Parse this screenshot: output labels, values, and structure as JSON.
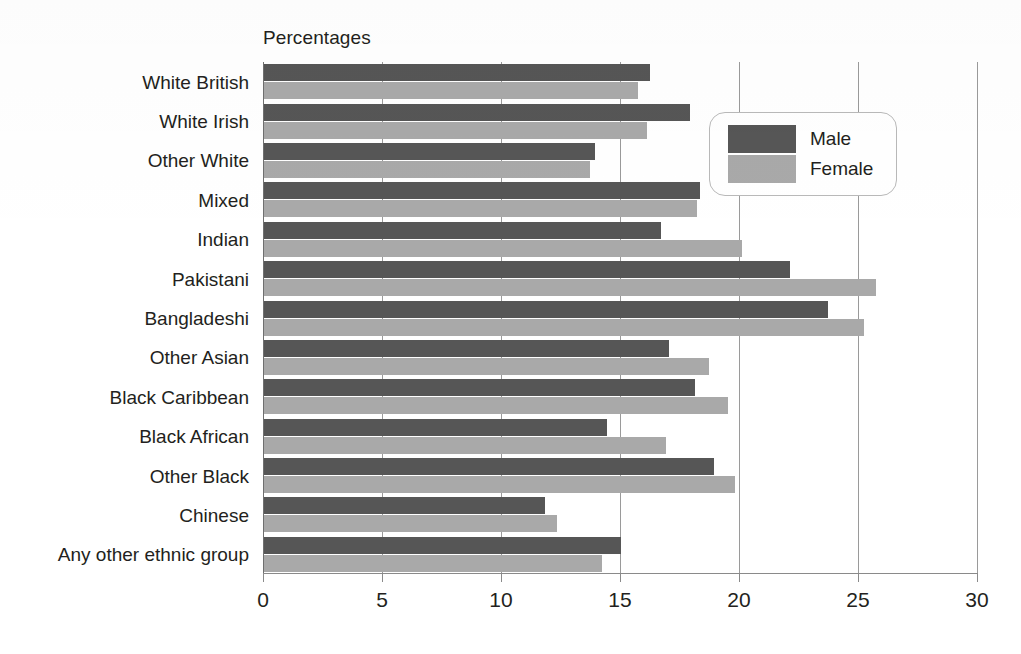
{
  "chart_data": {
    "type": "bar",
    "orientation": "horizontal",
    "title": "Percentages",
    "xlabel": "",
    "ylabel": "",
    "xlim": [
      0,
      30
    ],
    "xticks": [
      0,
      5,
      10,
      15,
      20,
      25,
      30
    ],
    "xtick_labels": [
      "0",
      "5",
      "10",
      "15",
      "20",
      "25",
      "30"
    ],
    "grid": true,
    "grid_axis": "x",
    "legend_position": "upper right",
    "categories": [
      "White British",
      "White Irish",
      "Other White",
      "Mixed",
      "Indian",
      "Pakistani",
      "Bangladeshi",
      "Other Asian",
      "Black Caribbean",
      "Black African",
      "Other Black",
      "Chinese",
      "Any other ethnic group"
    ],
    "series": [
      {
        "name": "Male",
        "color": "#565656",
        "values": [
          16.2,
          17.9,
          13.9,
          18.3,
          16.7,
          22.1,
          23.7,
          17.0,
          18.1,
          14.4,
          18.9,
          11.8,
          15.0
        ]
      },
      {
        "name": "Female",
        "color": "#a9a9a9",
        "values": [
          15.7,
          16.1,
          13.7,
          18.2,
          20.1,
          25.7,
          25.2,
          18.7,
          19.5,
          16.9,
          19.8,
          12.3,
          14.2
        ]
      }
    ]
  }
}
